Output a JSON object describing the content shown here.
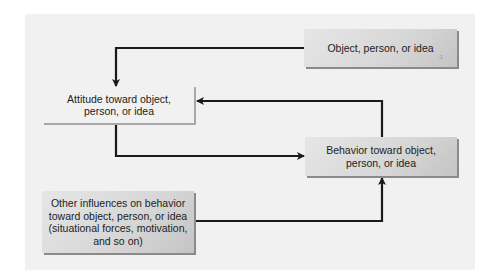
{
  "diagram": {
    "type": "flowchart",
    "nodes": {
      "object": {
        "label": "Object, person, or idea",
        "tag": "-1"
      },
      "attitude": {
        "label": "Attitude toward object,\nperson, or idea"
      },
      "behavior": {
        "label": "Behavior toward object,\nperson, or idea"
      },
      "other": {
        "label": "Other influences on behavior\ntoward object, person, or idea\n(situational forces, motivation,\nand so on)"
      }
    },
    "edges": [
      {
        "from": "object",
        "to": "attitude"
      },
      {
        "from": "attitude",
        "to": "behavior"
      },
      {
        "from": "behavior",
        "to": "attitude"
      },
      {
        "from": "other",
        "to": "behavior"
      }
    ],
    "colors": {
      "panel": "#f1f1f1",
      "box_fill": "#d9d9d9",
      "arrow": "#1a1a1a",
      "text": "#222222"
    }
  }
}
